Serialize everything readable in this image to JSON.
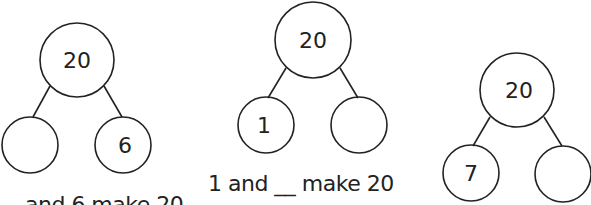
{
  "bonds": [
    {
      "whole": "20",
      "left": "",
      "right": "6",
      "sentence": "_ and 6 make 20"
    },
    {
      "whole": "20",
      "left": "1",
      "right": "",
      "sentence": "1 and __ make 20"
    },
    {
      "whole": "20",
      "left": "7",
      "right": "",
      "sentence": ""
    }
  ]
}
